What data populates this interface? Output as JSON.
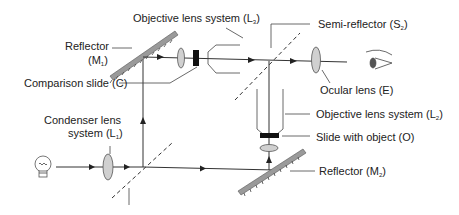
{
  "diagram": {
    "labels": {
      "objective_top": {
        "text": "Objective lens system (L",
        "sub": "3",
        "close": ")"
      },
      "semi_reflector": {
        "text": "Semi-reflector (S",
        "sub": "2",
        "close": ")"
      },
      "reflector_m1_line1": "Reflector",
      "reflector_m1_line2": {
        "text": "(M",
        "sub": "1",
        "close": ")"
      },
      "comparison_slide": "Comparison slide (C)",
      "ocular_lens": "Ocular lens (E)",
      "objective_right": {
        "text": "Objective lens system (L",
        "sub": "2",
        "close": ")"
      },
      "slide_object": "Slide with object (O)",
      "condenser_line1": "Condenser lens",
      "condenser_line2": {
        "text": "system (L",
        "sub": "1",
        "close": ")"
      },
      "reflector_m2": {
        "text": "Reflector (M",
        "sub": "2",
        "close": ")"
      }
    },
    "icons": [
      "light-bulb-icon",
      "eye-icon"
    ],
    "colors": {
      "line": "#333333",
      "lens_fill": "#d0d0d0",
      "mirror_fill": "#9a9a9a"
    }
  }
}
